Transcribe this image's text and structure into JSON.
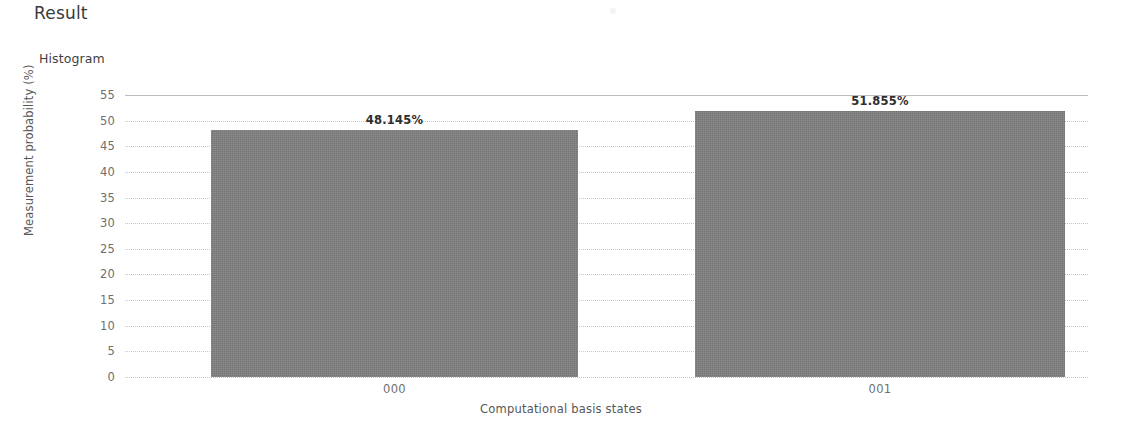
{
  "header": {
    "title": "Result"
  },
  "chart_data": {
    "type": "bar",
    "title": "Histogram",
    "xlabel": "Computational basis states",
    "ylabel": "Measurement probability (%)",
    "categories": [
      "000",
      "001"
    ],
    "values": [
      48.145,
      51.855
    ],
    "value_labels": [
      "48.145%",
      "51.855%"
    ],
    "ylim": [
      0,
      55
    ],
    "yticks": [
      0,
      5,
      10,
      15,
      20,
      25,
      30,
      35,
      40,
      45,
      50,
      55
    ],
    "ytick_labels": [
      "0",
      "5",
      "10",
      "15",
      "20",
      "25",
      "30",
      "35",
      "40",
      "45",
      "50",
      "55"
    ],
    "grid": true,
    "grid_axis": "y",
    "legend": false,
    "legend_position": "none",
    "bar_color": "#7f7f7f",
    "grid_color": "#c9c9c9",
    "label_color": "#2e2e2e",
    "axis_text_color": "#6f6f6f"
  }
}
